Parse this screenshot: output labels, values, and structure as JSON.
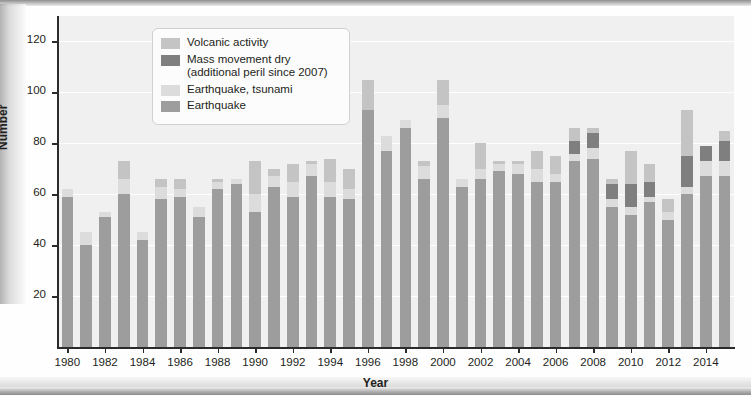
{
  "chart_data": {
    "type": "bar",
    "title": "",
    "xlabel": "Year",
    "ylabel": "Number",
    "ylim": [
      0,
      130
    ],
    "yticks": [
      20,
      40,
      60,
      80,
      100,
      120
    ],
    "xticks": [
      1980,
      1982,
      1984,
      1986,
      1988,
      1990,
      1992,
      1994,
      1996,
      1998,
      2000,
      2002,
      2004,
      2006,
      2008,
      2010,
      2012,
      2014
    ],
    "grid": true,
    "stacked": true,
    "legend_position": "top-center",
    "categories": [
      1980,
      1981,
      1982,
      1983,
      1984,
      1985,
      1986,
      1987,
      1988,
      1989,
      1990,
      1991,
      1992,
      1993,
      1994,
      1995,
      1996,
      1997,
      1998,
      1999,
      2000,
      2001,
      2002,
      2003,
      2004,
      2005,
      2006,
      2007,
      2008,
      2009,
      2010,
      2011,
      2012,
      2013,
      2014,
      2015
    ],
    "series": [
      {
        "name": "Earthquake",
        "color": "#9d9d9d",
        "values": [
          59,
          40,
          51,
          60,
          42,
          58,
          59,
          51,
          62,
          64,
          53,
          63,
          59,
          67,
          59,
          58,
          93,
          77,
          86,
          66,
          90,
          63,
          66,
          69,
          68,
          65,
          65,
          73,
          74,
          55,
          52,
          57,
          50,
          60,
          67,
          67
        ]
      },
      {
        "name": "Earthquake, tsunami",
        "color": "#dcdcdc",
        "values": [
          3,
          5,
          2,
          6,
          3,
          5,
          3,
          4,
          3,
          2,
          7,
          4,
          6,
          5,
          6,
          4,
          0,
          6,
          3,
          5,
          5,
          3,
          4,
          3,
          4,
          5,
          3,
          3,
          4,
          3,
          3,
          2,
          3,
          3,
          6,
          6
        ]
      },
      {
        "name": "Mass movement dry (additional peril since 2007)",
        "color": "#7f7f7f",
        "values": [
          0,
          0,
          0,
          0,
          0,
          0,
          0,
          0,
          0,
          0,
          0,
          0,
          0,
          0,
          0,
          0,
          0,
          0,
          0,
          0,
          0,
          0,
          0,
          0,
          0,
          0,
          0,
          5,
          6,
          6,
          9,
          6,
          0,
          12,
          6,
          8
        ]
      },
      {
        "name": "Volcanic activity",
        "color": "#c4c4c4",
        "values": [
          0,
          0,
          0,
          7,
          0,
          3,
          4,
          0,
          1,
          0,
          13,
          3,
          7,
          1,
          9,
          8,
          12,
          0,
          0,
          2,
          10,
          0,
          10,
          1,
          1,
          7,
          7,
          5,
          2,
          2,
          13,
          7,
          5,
          18,
          0,
          4
        ]
      }
    ],
    "stack_order": [
      "Earthquake",
      "Earthquake, tsunami",
      "Mass movement dry (additional peril since 2007)",
      "Volcanic activity"
    ]
  },
  "legend": {
    "items": [
      {
        "label": "Volcanic activity",
        "sub": "",
        "color": "#c4c4c4"
      },
      {
        "label": "Mass movement dry",
        "sub": "(additional peril since 2007)",
        "color": "#7f7f7f"
      },
      {
        "label": "Earthquake, tsunami",
        "sub": "",
        "color": "#dcdcdc"
      },
      {
        "label": "Earthquake",
        "sub": "",
        "color": "#9d9d9d"
      }
    ]
  },
  "axes": {
    "ylabel": "Number",
    "xlabel": "Year"
  }
}
